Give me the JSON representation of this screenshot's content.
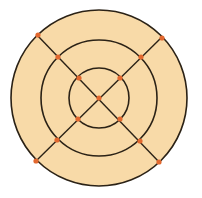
{
  "diagram": {
    "type": "concentric-circles-with-diagonals",
    "width": 202,
    "height": 198,
    "center": [
      99,
      98
    ],
    "colors": {
      "background": "#ffffff",
      "fill": "#f8daa8",
      "stroke": "#2b2216",
      "point": "#e2682f"
    },
    "circles": [
      {
        "name": "outer-circle",
        "r": 88
      },
      {
        "name": "middle-circle",
        "r": 58
      },
      {
        "name": "inner-circle",
        "r": 30
      }
    ],
    "lines": [
      {
        "name": "diagonal-line-1",
        "from": [
          37,
          35
        ],
        "to": [
          160,
          163
        ]
      },
      {
        "name": "diagonal-line-2",
        "from": [
          162,
          37
        ],
        "to": [
          36,
          161
        ]
      }
    ],
    "points": [
      {
        "name": "point-center",
        "x": 99,
        "y": 98
      },
      {
        "name": "point-inner-nw",
        "x": 79,
        "y": 78
      },
      {
        "name": "point-inner-ne",
        "x": 120,
        "y": 78
      },
      {
        "name": "point-inner-sw",
        "x": 78,
        "y": 119
      },
      {
        "name": "point-inner-se",
        "x": 120,
        "y": 119
      },
      {
        "name": "point-middle-nw",
        "x": 58,
        "y": 57
      },
      {
        "name": "point-middle-ne",
        "x": 141,
        "y": 57
      },
      {
        "name": "point-middle-sw",
        "x": 57,
        "y": 140
      },
      {
        "name": "point-middle-se",
        "x": 140,
        "y": 141
      },
      {
        "name": "point-outer-nw",
        "x": 38,
        "y": 35
      },
      {
        "name": "point-outer-ne",
        "x": 162,
        "y": 38
      },
      {
        "name": "point-outer-sw",
        "x": 36,
        "y": 161
      },
      {
        "name": "point-outer-se",
        "x": 159,
        "y": 162
      }
    ]
  }
}
